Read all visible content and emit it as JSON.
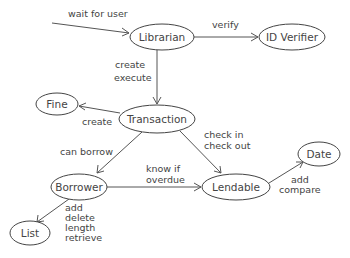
{
  "diagram": {
    "type": "object-interaction-diagram",
    "nodes": [
      {
        "id": "librarian",
        "label": "Librarian",
        "cx": 162,
        "cy": 37,
        "rx": 32,
        "ry": 13
      },
      {
        "id": "id_verifier",
        "label": "ID Verifier",
        "cx": 292,
        "cy": 37,
        "rx": 33,
        "ry": 13
      },
      {
        "id": "transaction",
        "label": "Transaction",
        "cx": 157,
        "cy": 119,
        "rx": 38,
        "ry": 14
      },
      {
        "id": "fine",
        "label": "Fine",
        "cx": 57,
        "cy": 104,
        "rx": 21,
        "ry": 11
      },
      {
        "id": "borrower",
        "label": "Borrower",
        "cx": 79,
        "cy": 187,
        "rx": 28,
        "ry": 13
      },
      {
        "id": "lendable",
        "label": "Lendable",
        "cx": 236,
        "cy": 187,
        "rx": 34,
        "ry": 13
      },
      {
        "id": "date",
        "label": "Date",
        "cx": 319,
        "cy": 154,
        "rx": 21,
        "ry": 12
      },
      {
        "id": "list",
        "label": "List",
        "cx": 30,
        "cy": 233,
        "rx": 20,
        "ry": 12
      }
    ],
    "edges": [
      {
        "from": "external",
        "to": "librarian",
        "labels": [
          "wait for user"
        ]
      },
      {
        "from": "librarian",
        "to": "id_verifier",
        "labels": [
          "verify"
        ]
      },
      {
        "from": "librarian",
        "to": "transaction",
        "labels": [
          "create",
          "execute"
        ]
      },
      {
        "from": "transaction",
        "to": "fine",
        "labels": [
          "create"
        ]
      },
      {
        "from": "transaction",
        "to": "borrower",
        "labels": [
          "can borrow"
        ]
      },
      {
        "from": "transaction",
        "to": "lendable",
        "labels": [
          "check in",
          "check out"
        ]
      },
      {
        "from": "borrower",
        "to": "lendable",
        "labels": [
          "know if",
          "overdue"
        ]
      },
      {
        "from": "lendable",
        "to": "date",
        "labels": [
          "add",
          "compare"
        ]
      },
      {
        "from": "borrower",
        "to": "list",
        "labels": [
          "add",
          "delete",
          "length",
          "retrieve"
        ]
      }
    ]
  },
  "labels": {
    "wait_for_user": "wait for user",
    "verify": "verify",
    "create_execute_1": "create",
    "create_execute_2": "execute",
    "fine_create": "create",
    "can_borrow": "can borrow",
    "check_in": "check in",
    "check_out": "check out",
    "know_if": "know if",
    "overdue": "overdue",
    "date_add": "add",
    "date_compare": "compare",
    "list_add": "add",
    "list_delete": "delete",
    "list_length": "length",
    "list_retrieve": "retrieve"
  },
  "nodes_text": {
    "librarian": "Librarian",
    "id_verifier": "ID Verifier",
    "transaction": "Transaction",
    "fine": "Fine",
    "borrower": "Borrower",
    "lendable": "Lendable",
    "date": "Date",
    "list": "List"
  }
}
